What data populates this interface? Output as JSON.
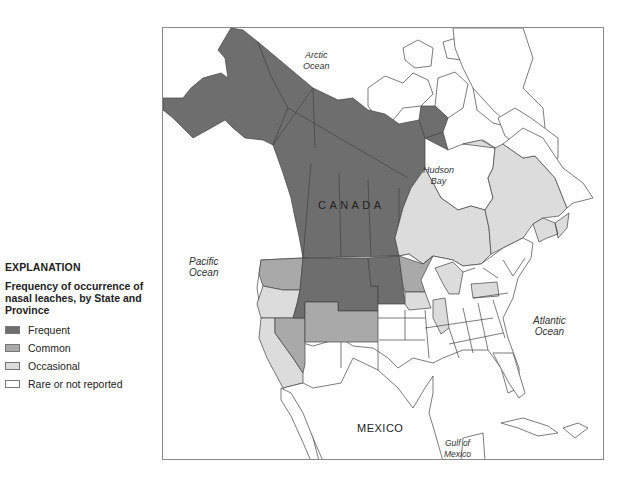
{
  "legend": {
    "title": "EXPLANATION",
    "subtitle": "Frequency of occurrence of nasal leaches, by State and Province",
    "items": [
      {
        "label": "Frequent",
        "color": "#6e6e6e"
      },
      {
        "label": "Common",
        "color": "#a9a9a9"
      },
      {
        "label": "Occasional",
        "color": "#dcdcdc"
      },
      {
        "label": "Rare or not reported",
        "color": "#ffffff"
      }
    ]
  },
  "map": {
    "labels": {
      "arctic": "Arctic\nOcean",
      "hudson": "Hudson\nBay",
      "pacific": "Pacific\nOcean",
      "atlantic": "Atlantic\nOcean",
      "gulf": "Gulf of\nMexico",
      "canada": "C A N A D A",
      "mexico": "MEXICO"
    },
    "regions": {
      "frequent": [
        "Alaska",
        "Yukon",
        "Northwest Territories",
        "British Columbia",
        "Alberta",
        "Saskatchewan",
        "Manitoba",
        "Idaho",
        "Montana",
        "Wyoming",
        "North Dakota",
        "South Dakota"
      ],
      "common": [
        "Washington",
        "Nevada",
        "Utah",
        "Colorado",
        "Minnesota"
      ],
      "occasional": [
        "Oregon",
        "California",
        "Iowa",
        "Illinois",
        "Michigan",
        "Pennsylvania",
        "Ontario",
        "Quebec",
        "New Brunswick",
        "Nova Scotia"
      ],
      "rare": [
        "Other states",
        "Mexico"
      ]
    }
  }
}
